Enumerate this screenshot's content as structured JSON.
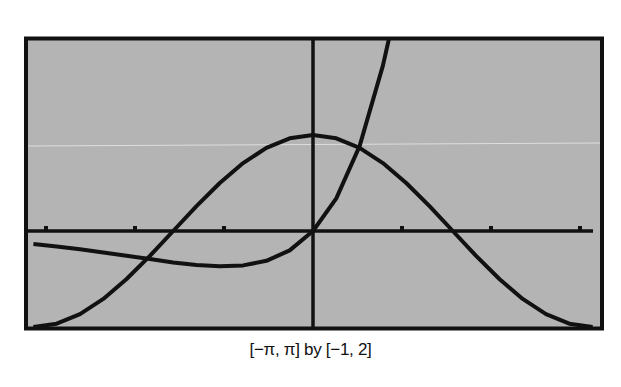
{
  "caption": "[−π, π] by [−1, 2]",
  "colors": {
    "background": "#b4b4b4",
    "ink": "#111111",
    "page": "#ffffff"
  },
  "chart_data": {
    "type": "line",
    "title": "",
    "caption": "[−π, π] by [−1, 2]",
    "xlabel": "",
    "ylabel": "",
    "xlim": [
      -3.14159,
      3.14159
    ],
    "ylim": [
      -1,
      2
    ],
    "x_tick_spacing": 1,
    "x_ticks": [
      -3,
      -2,
      -1,
      1,
      2,
      3
    ],
    "grid": false,
    "legend": null,
    "series": [
      {
        "name": "y = cos x",
        "x": [
          -3.1416,
          -2.8798,
          -2.618,
          -2.3562,
          -2.0944,
          -1.8326,
          -1.5708,
          -1.309,
          -1.0472,
          -0.7854,
          -0.5236,
          -0.2618,
          0,
          0.2618,
          0.5236,
          0.7854,
          1.0472,
          1.309,
          1.5708,
          1.8326,
          2.0944,
          2.3562,
          2.618,
          2.8798,
          3.1416
        ],
        "y": [
          -1,
          -0.966,
          -0.866,
          -0.707,
          -0.5,
          -0.259,
          0,
          0.259,
          0.5,
          0.707,
          0.866,
          0.966,
          1,
          0.966,
          0.866,
          0.707,
          0.5,
          0.259,
          0,
          -0.259,
          -0.5,
          -0.707,
          -0.866,
          -0.966,
          -1
        ]
      },
      {
        "name": "y = x e^x",
        "x": [
          -3.1416,
          -2.8798,
          -2.618,
          -2.3562,
          -2.0944,
          -1.8326,
          -1.5708,
          -1.309,
          -1.0472,
          -0.7854,
          -0.5236,
          -0.2618,
          0,
          0.2618,
          0.5236,
          0.7854,
          0.8526,
          1.0472
        ],
        "y": [
          -0.136,
          -0.162,
          -0.191,
          -0.223,
          -0.258,
          -0.293,
          -0.327,
          -0.354,
          -0.367,
          -0.358,
          -0.31,
          -0.202,
          0,
          0.34,
          0.884,
          1.723,
          2.0,
          2.984
        ]
      }
    ]
  }
}
